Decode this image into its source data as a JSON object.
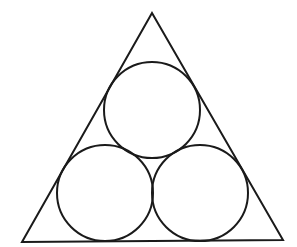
{
  "diagram": {
    "stroke_color": "#1a1a1a",
    "background_color": "#ffffff",
    "stroke_width": 2,
    "triangle": {
      "points": [
        [
          152,
          13
        ],
        [
          22,
          242
        ],
        [
          283,
          240
        ]
      ]
    },
    "circles": [
      {
        "id": "top",
        "cx": 152,
        "cy": 110,
        "r": 48
      },
      {
        "id": "bottom-left",
        "cx": 105,
        "cy": 193,
        "r": 48
      },
      {
        "id": "bottom-right",
        "cx": 200,
        "cy": 193,
        "r": 48
      }
    ]
  }
}
